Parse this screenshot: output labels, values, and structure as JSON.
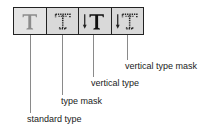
{
  "toolbar": {
    "tools": [
      {
        "id": "standard-type",
        "icon": "type-icon",
        "label": "standard type"
      },
      {
        "id": "type-mask",
        "icon": "type-mask-icon",
        "label": "type mask"
      },
      {
        "id": "vertical-type",
        "icon": "vertical-type-icon",
        "label": "vertical type"
      },
      {
        "id": "vertical-type-mask",
        "icon": "vertical-type-mask-icon",
        "label": "vertical type mask"
      }
    ]
  },
  "callouts": {
    "standard_type": "standard type",
    "type_mask": "type mask",
    "vertical_type": "vertical type",
    "vertical_type_mask": "vertical type mask"
  }
}
